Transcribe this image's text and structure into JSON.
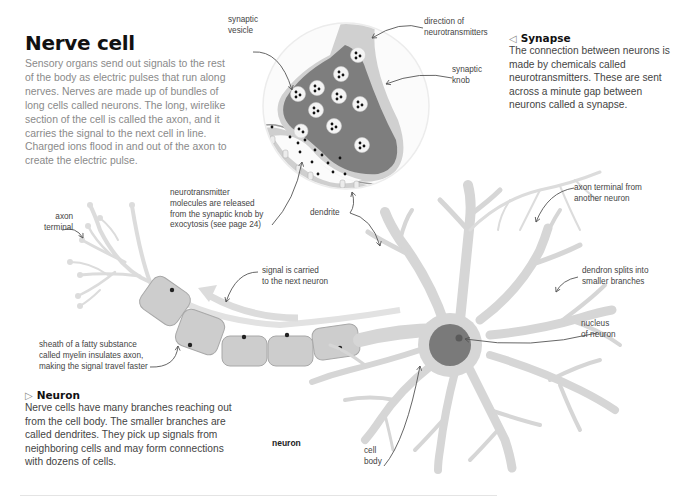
{
  "title": "Nerve cell",
  "intro": "Sensory organs send out signals to the rest of the body as electric pulses that run along nerves. Nerves are made up of bundles of long cells called neurons. The long, wirelike section of the cell is called the axon, and it carries the signal to the next cell in line. Charged ions flood in and out of the axon to create the electric pulse.",
  "synapse_panel": {
    "icon": "triangle-left-icon",
    "heading": "Synapse",
    "body": "The connection between neurons is made by chemicals called neurotransmitters. These are sent across a minute gap between neurons called a synapse."
  },
  "neuron_panel": {
    "icon": "triangle-right-icon",
    "heading": "Neuron",
    "body": "Nerve cells have many branches reaching out from the cell body. The smaller branches are called dendrites. They pick up signals from neighboring cells and may form connections with dozens of cells."
  },
  "labels": {
    "synaptic_vesicle": [
      "synaptic",
      "vesicle"
    ],
    "direction": [
      "direction of",
      "neurotransmitters"
    ],
    "synaptic_knob": [
      "synaptic",
      "knob"
    ],
    "neurotransmitter_release": [
      "neurotransmitter",
      "molecules are released",
      "from the synaptic knob by",
      "exocytosis (see page 24)"
    ],
    "dendrite": "dendrite",
    "axon_terminal": [
      "axon",
      "terminal"
    ],
    "signal_carried": [
      "signal is carried",
      "to the next neuron"
    ],
    "myelin": [
      "sheath of a fatty substance",
      "called myelin insulates axon,",
      "making the signal travel faster"
    ],
    "axon_terminal_other": [
      "axon terminal from",
      "another neuron"
    ],
    "dendron_splits": [
      "dendron splits into",
      "smaller branches"
    ],
    "nucleus": [
      "nucleus",
      "of neuron"
    ],
    "neuron": "neuron",
    "cell_body": [
      "cell",
      "body"
    ]
  },
  "colors": {
    "knob": "#7c7c7c",
    "knob_rim": "#bdbdbd",
    "circle_bg": "#f2f2f2",
    "dendrite_gray": "#d3d3d3",
    "neuron_gray": "#d8d8d8",
    "nucleus": "#7a7a7a",
    "myelin": "#c9c9c9",
    "leader": "#555555"
  }
}
